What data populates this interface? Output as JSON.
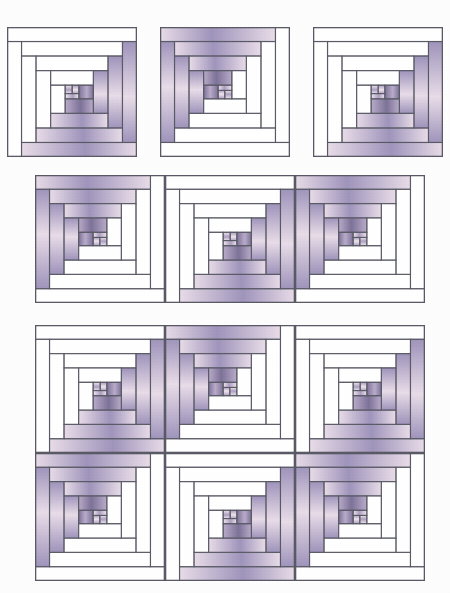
{
  "document": {
    "title": "Log Cabin Quilt Block Layout Diagram",
    "subject": "log-cabin-quilt-blocks",
    "background_color": "#fdfdfd"
  },
  "palette": {
    "background": "#ffffff",
    "outline": "#5a5a66",
    "light_fabric": "#ffffff",
    "medium_fabric_light_end": "#e8dce8",
    "medium_fabric_dark_end": "#9f94bb",
    "dark_fabric_light_end": "#b9abc9",
    "dark_fabric_dark_end": "#7d7298",
    "center_fabric_light_end": "#f0e4ec",
    "center_fabric_dark_end": "#ab9fc2"
  },
  "block_design": {
    "name": "Log Cabin",
    "grid_units": 12,
    "center_unit_size": 2,
    "log_width_units": 1.6,
    "rounds": 4,
    "light_half": "upper-left",
    "dark_half": "lower-right",
    "orientation_a_label": "dark-lower-right",
    "orientation_b_label": "dark-upper-left"
  },
  "arrangements": [
    {
      "id": "row-single-blocks",
      "label": "Row of three separated blocks",
      "columns": 3,
      "rows": 1,
      "gap": true,
      "blocks": [
        {
          "index": 0,
          "orientation": "A"
        },
        {
          "index": 1,
          "orientation": "B"
        },
        {
          "index": 2,
          "orientation": "A"
        }
      ]
    },
    {
      "id": "row-joined-blocks",
      "label": "Row of three joined blocks",
      "columns": 3,
      "rows": 1,
      "gap": false,
      "blocks": [
        {
          "index": 0,
          "orientation": "B"
        },
        {
          "index": 1,
          "orientation": "A"
        },
        {
          "index": 2,
          "orientation": "B"
        }
      ]
    },
    {
      "id": "grid-six-blocks",
      "label": "Two by three block set forming the quilt pattern",
      "columns": 3,
      "rows": 2,
      "gap": false,
      "blocks": [
        {
          "index": 0,
          "orientation": "A"
        },
        {
          "index": 1,
          "orientation": "B"
        },
        {
          "index": 2,
          "orientation": "A"
        },
        {
          "index": 3,
          "orientation": "B"
        },
        {
          "index": 4,
          "orientation": "A"
        },
        {
          "index": 5,
          "orientation": "B"
        }
      ]
    }
  ],
  "geometry": {
    "canvas_width": 450,
    "canvas_height": 593,
    "block_size": 130,
    "row1": {
      "x": 7,
      "y": 27,
      "gap": 20
    },
    "row2": {
      "x": 35,
      "y": 175
    },
    "row3": {
      "x": 35,
      "y": 325
    }
  }
}
